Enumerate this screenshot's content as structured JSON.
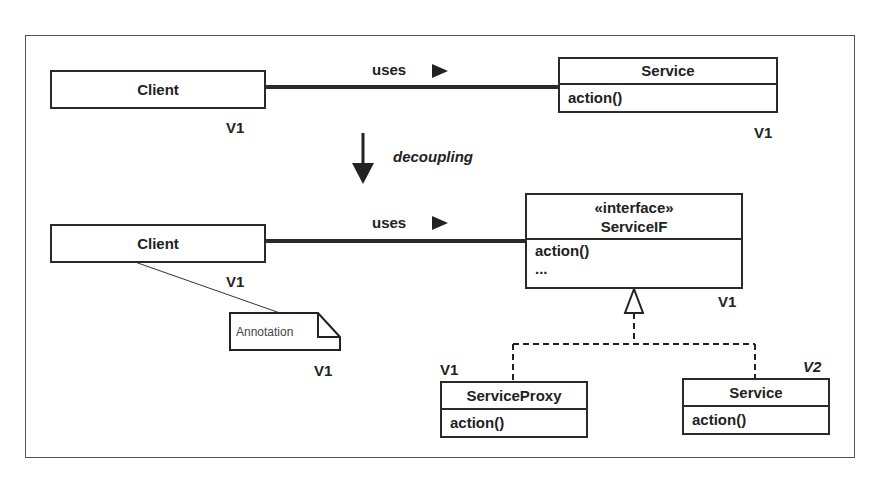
{
  "diagram": {
    "top": {
      "client": {
        "name": "Client",
        "version": "V1"
      },
      "association": {
        "label": "uses",
        "direction_glyph": "▶"
      },
      "service": {
        "name": "Service",
        "operations": [
          "action()"
        ],
        "version": "V1"
      }
    },
    "transition": {
      "label": "decoupling",
      "arrow_glyph": "↓"
    },
    "bottom": {
      "client": {
        "name": "Client",
        "version": "V1"
      },
      "association": {
        "label": "uses",
        "direction_glyph": "▶"
      },
      "interface": {
        "stereotype": "«interface»",
        "name": "ServiceIF",
        "operations": [
          "action()",
          "..."
        ],
        "version": "V1"
      },
      "annotation": {
        "text": "Annotation",
        "version": "V1"
      },
      "proxy": {
        "name": "ServiceProxy",
        "operations": [
          "action()"
        ],
        "version": "V1"
      },
      "service": {
        "name": "Service",
        "operations": [
          "action()"
        ],
        "version": "V2"
      }
    }
  },
  "colors": {
    "line": "#2a2a2a",
    "frame": "#555555",
    "background": "#ffffff"
  }
}
